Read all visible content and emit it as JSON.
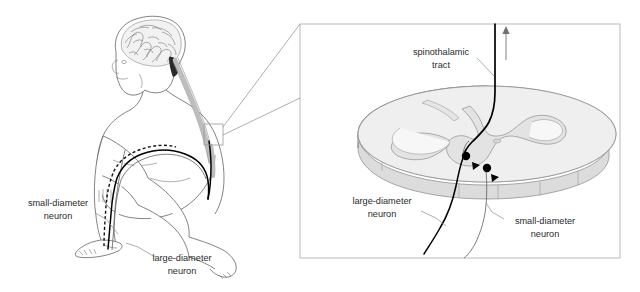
{
  "figure": {
    "background_color": "#ffffff",
    "width": 640,
    "height": 292
  },
  "left_panel": {
    "name": "whole-body-view",
    "description": "Side view of a kneeling person showing brain, spinal cord and peripheral nerves running down the leg to the foot",
    "labels": [
      {
        "id": "small-diameter-neuron",
        "line1": "small-diameter",
        "line2": "neuron",
        "x": 58,
        "y": 208
      },
      {
        "id": "large-diameter-neuron",
        "line1": "large-diameter",
        "line2": "neuron",
        "x": 180,
        "y": 262
      }
    ],
    "callout": {
      "name": "spinal-cord-callout-box",
      "x": 204,
      "y": 124,
      "width": 19,
      "height": 21
    }
  },
  "right_panel": {
    "name": "spinal-cord-cross-section-panel",
    "description": "Enlarged three-dimensional slab of the spinal cord showing butterfly-shaped gray matter, synaptic terminals and the ascending spinothalamic tract",
    "border_color": "#b9b9b9",
    "bounds": {
      "x": 300,
      "y": 24,
      "width": 320,
      "height": 234
    },
    "labels": [
      {
        "id": "spinothalamic-tract",
        "line1": "spinothalamic",
        "line2": "tract",
        "x": 441,
        "y": 57
      },
      {
        "id": "large-diameter-neuron",
        "line1": "large-diameter",
        "line2": "neuron",
        "x": 382,
        "y": 206
      },
      {
        "id": "small-diameter-neuron",
        "line1": "small-diameter",
        "line2": "neuron",
        "x": 533,
        "y": 224
      }
    ],
    "arrow": {
      "id": "ascending-direction-arrow",
      "direction": "up",
      "x": 506,
      "y_top": 27,
      "y_bottom": 60
    },
    "synapses": [
      {
        "id": "synapse-upper",
        "cx": 466,
        "cy": 156
      },
      {
        "id": "synapse-lower",
        "cx": 486,
        "cy": 169
      }
    ]
  },
  "colors": {
    "text": "#2b2b2b",
    "leader": "#8d8d8d",
    "outline": "#5a5a5a",
    "slab_top": "#efefef",
    "slab_side": "#dcdcdc",
    "gray_matter": "#e3e3e3",
    "axon_large": "#000000",
    "panel_border": "#b9b9b9"
  }
}
